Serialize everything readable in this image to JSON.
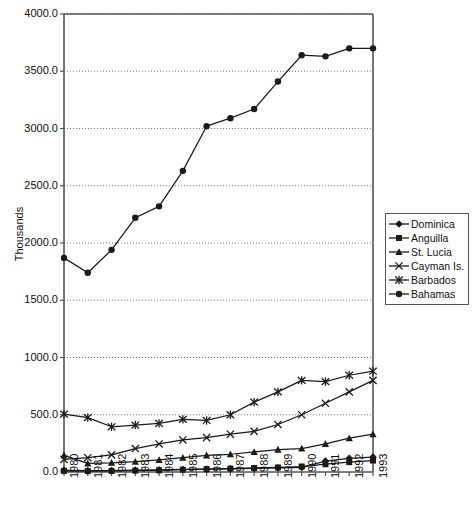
{
  "chart_data": {
    "type": "line",
    "title": "",
    "xlabel": "",
    "ylabel": "Thousands",
    "ylim": [
      0,
      4000
    ],
    "ytick_labels": [
      "4000.0",
      "3500.0",
      "3000.0",
      "2500.0",
      "2000.0",
      "1500.0",
      "1000.0",
      "500.0",
      "0.0"
    ],
    "ytick_values": [
      4000,
      3500,
      3000,
      2500,
      2000,
      1500,
      1000,
      500,
      0
    ],
    "grid": "horizontal-dotted",
    "legend_position": "right",
    "categories": [
      "1980",
      "1981",
      "1982",
      "1983",
      "1984",
      "1985",
      "1986",
      "1987",
      "1988",
      "1989",
      "1990",
      "1991",
      "1992",
      "1993"
    ],
    "x": [
      1980,
      1981,
      1982,
      1983,
      1984,
      1985,
      1986,
      1987,
      1988,
      1989,
      1990,
      1991,
      1992,
      1993
    ],
    "series": [
      {
        "name": "Dominica",
        "marker": "diamond",
        "values": [
          15,
          12,
          13,
          16,
          19,
          22,
          25,
          27,
          31,
          35,
          40,
          95,
          120,
          130
        ]
      },
      {
        "name": "Anguilla",
        "marker": "square",
        "values": [
          10,
          8,
          9,
          12,
          15,
          20,
          25,
          30,
          35,
          40,
          48,
          68,
          86,
          100
        ]
      },
      {
        "name": "St. Lucia",
        "marker": "triangle",
        "values": [
          145,
          75,
          80,
          90,
          105,
          125,
          145,
          155,
          175,
          195,
          205,
          245,
          295,
          330
        ]
      },
      {
        "name": "Cayman Is.",
        "marker": "cross",
        "values": [
          110,
          125,
          150,
          205,
          245,
          280,
          300,
          330,
          355,
          415,
          500,
          600,
          700,
          800
        ]
      },
      {
        "name": "Barbados",
        "marker": "star",
        "values": [
          505,
          475,
          395,
          410,
          425,
          460,
          450,
          500,
          610,
          700,
          800,
          790,
          845,
          880
        ]
      },
      {
        "name": "Bahamas",
        "marker": "circle",
        "values": [
          1870,
          1740,
          1940,
          2220,
          2320,
          2630,
          3020,
          3090,
          3170,
          3410,
          3640,
          3630,
          3700,
          3700
        ]
      }
    ]
  },
  "legend": {
    "items": [
      {
        "label": "Dominica"
      },
      {
        "label": "Anguilla"
      },
      {
        "label": "St. Lucia"
      },
      {
        "label": "Cayman Is."
      },
      {
        "label": "Barbados"
      },
      {
        "label": "Bahamas"
      }
    ]
  },
  "colors": {
    "line": "#1a1a1a",
    "axis": "#555555",
    "grid": "#777777",
    "background": "#ffffff"
  }
}
